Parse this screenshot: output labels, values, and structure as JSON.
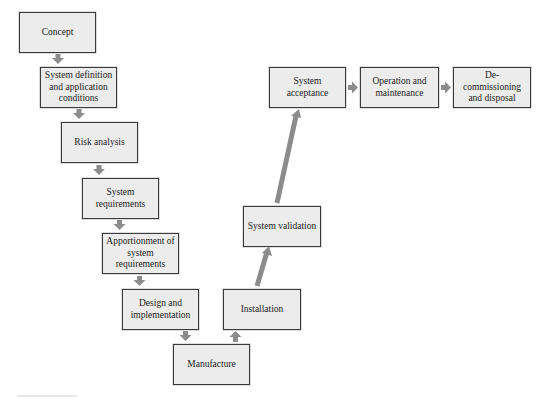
{
  "diagram": {
    "type": "lifecycle-v-model",
    "colors": {
      "box_fill": "#ececec",
      "box_border": "#3a3a3a",
      "arrow": "#8c8c8c",
      "text": "#222222"
    },
    "nodes": [
      {
        "id": "concept",
        "label": "Concept"
      },
      {
        "id": "system-definition",
        "label": "System definition and application conditions"
      },
      {
        "id": "risk-analysis",
        "label": "Risk analysis"
      },
      {
        "id": "system-requirements",
        "label": "System requirements"
      },
      {
        "id": "apportionment",
        "label": "Apportionment of system requirements"
      },
      {
        "id": "design-implementation",
        "label": "Design and implementation"
      },
      {
        "id": "manufacture",
        "label": "Manufacture"
      },
      {
        "id": "installation",
        "label": "Installation"
      },
      {
        "id": "system-validation",
        "label": "System validation"
      },
      {
        "id": "system-acceptance",
        "label": "System acceptance"
      },
      {
        "id": "operation-maintenance",
        "label": "Operation and maintenance"
      },
      {
        "id": "decommissioning",
        "label": "De-commissioning and disposal"
      }
    ],
    "edges": [
      [
        "concept",
        "system-definition"
      ],
      [
        "system-definition",
        "risk-analysis"
      ],
      [
        "risk-analysis",
        "system-requirements"
      ],
      [
        "system-requirements",
        "apportionment"
      ],
      [
        "apportionment",
        "design-implementation"
      ],
      [
        "design-implementation",
        "manufacture"
      ],
      [
        "manufacture",
        "installation"
      ],
      [
        "installation",
        "system-validation"
      ],
      [
        "system-validation",
        "system-acceptance"
      ],
      [
        "system-acceptance",
        "operation-maintenance"
      ],
      [
        "operation-maintenance",
        "decommissioning"
      ]
    ]
  }
}
